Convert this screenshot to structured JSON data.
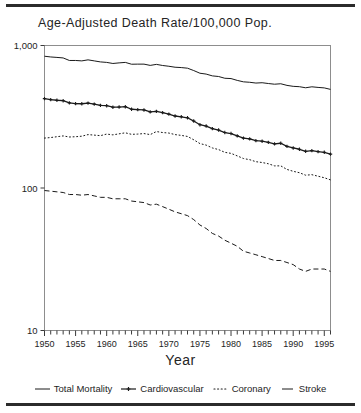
{
  "chart_data": {
    "type": "line",
    "title": "Age-Adjusted Death Rate/100,000 Pop.",
    "xlabel": "Year",
    "ylabel": "",
    "yscale": "log",
    "ylim": [
      10,
      1000
    ],
    "ytick_labels": [
      "1,000",
      "100",
      "10"
    ],
    "ytick_values": [
      1000,
      100,
      10
    ],
    "xlim": [
      1950,
      1996
    ],
    "xtick_labels": [
      "1950",
      "1955",
      "1960",
      "1965",
      "1970",
      "1975",
      "1980",
      "1985",
      "1990",
      "1995"
    ],
    "xtick_values": [
      1950,
      1955,
      1960,
      1965,
      1970,
      1975,
      1980,
      1985,
      1990,
      1995
    ],
    "minor_xticks": "every 1 year",
    "grid": false,
    "legend_position": "below",
    "x": [
      1950,
      1951,
      1952,
      1953,
      1954,
      1955,
      1956,
      1957,
      1958,
      1959,
      1960,
      1961,
      1962,
      1963,
      1964,
      1965,
      1966,
      1967,
      1968,
      1969,
      1970,
      1971,
      1972,
      1973,
      1974,
      1975,
      1976,
      1977,
      1978,
      1979,
      1980,
      1981,
      1982,
      1983,
      1984,
      1985,
      1986,
      1987,
      1988,
      1989,
      1990,
      1991,
      1992,
      1993,
      1994,
      1995,
      1996
    ],
    "series": [
      {
        "name": "Total Mortality",
        "style": "solid",
        "marker": "none",
        "values": [
          841,
          831,
          825,
          818,
          785,
          785,
          780,
          793,
          780,
          767,
          761,
          748,
          755,
          761,
          739,
          740,
          740,
          725,
          737,
          724,
          715,
          704,
          700,
          693,
          667,
          639,
          630,
          612,
          606,
          589,
          586,
          569,
          556,
          552,
          545,
          548,
          541,
          535,
          539,
          525,
          517,
          514,
          505,
          513,
          508,
          504,
          492
        ]
      },
      {
        "name": "Cardiovascular",
        "style": "solid",
        "marker": "plus",
        "values": [
          424,
          417,
          413,
          410,
          396,
          391,
          390,
          394,
          388,
          380,
          378,
          369,
          370,
          372,
          357,
          355,
          353,
          342,
          345,
          338,
          330,
          320,
          316,
          311,
          295,
          278,
          272,
          261,
          255,
          245,
          241,
          232,
          224,
          221,
          215,
          213,
          209,
          204,
          206,
          196,
          191,
          187,
          181,
          183,
          180,
          178,
          173
        ]
      },
      {
        "name": "Coronary",
        "style": "dotted",
        "marker": "none",
        "values": [
          224,
          226,
          229,
          232,
          228,
          229,
          231,
          237,
          235,
          233,
          239,
          236,
          240,
          244,
          238,
          239,
          241,
          237,
          249,
          245,
          243,
          237,
          234,
          230,
          218,
          205,
          200,
          191,
          186,
          178,
          175,
          168,
          161,
          158,
          153,
          151,
          148,
          143,
          143,
          135,
          131,
          128,
          123,
          124,
          121,
          118,
          114
        ]
      },
      {
        "name": "Stroke",
        "style": "dashed",
        "marker": "none",
        "values": [
          96,
          95,
          94,
          93,
          90,
          90,
          89,
          90,
          88,
          86,
          86,
          84,
          84,
          84,
          81,
          80,
          79,
          76,
          77,
          74,
          71,
          68,
          66,
          64,
          60,
          55,
          52,
          48,
          46,
          43,
          41,
          39,
          36,
          35,
          34,
          33,
          32,
          31,
          31,
          30,
          29,
          27,
          26,
          27,
          27,
          27,
          26
        ]
      }
    ]
  },
  "legend": {
    "items": [
      {
        "label": "Total Mortality",
        "key": "solid-line-key"
      },
      {
        "label": "Cardiovascular",
        "key": "plus-marker-key"
      },
      {
        "label": "Coronary",
        "key": "dotted-line-key"
      },
      {
        "label": "Stroke",
        "key": "dashed-line-key"
      }
    ]
  }
}
